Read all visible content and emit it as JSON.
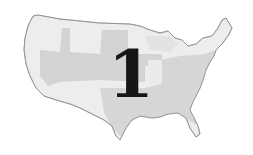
{
  "map": {
    "subject": "United States (contiguous)",
    "style": "grayscale shaded regions",
    "colors": {
      "background": "#ffffff",
      "light_region": "#ececec",
      "mid_region": "#d9d9d9",
      "outline": "#9a9a9a",
      "numeral": "#161616"
    }
  },
  "overlay": {
    "numeral": "1"
  }
}
